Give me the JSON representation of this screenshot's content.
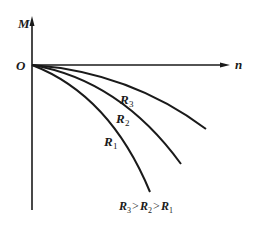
{
  "diagram": {
    "axes": {
      "y_label": "M",
      "x_label": "n",
      "origin_label": "O"
    },
    "curves": [
      {
        "name": "R",
        "subscript": "3"
      },
      {
        "name": "R",
        "subscript": "2"
      },
      {
        "name": "R",
        "subscript": "1"
      }
    ],
    "relation": {
      "parts": [
        "R",
        "3",
        ">",
        "R",
        "2",
        ">",
        "R",
        "1"
      ]
    },
    "colors": {
      "ink": "#1a1a1a",
      "background": "#ffffff"
    }
  }
}
